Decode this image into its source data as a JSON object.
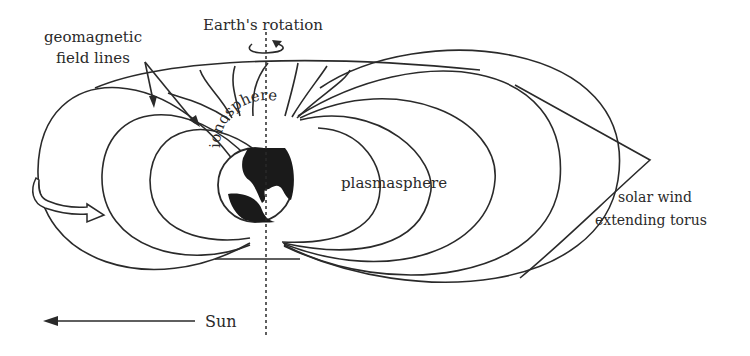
{
  "diagram": {
    "labels": {
      "geomagnetic_line1": "geomagnetic",
      "geomagnetic_line2": "field lines",
      "rotation": "Earth's rotation",
      "ionosphere": "ionosphere",
      "plasmasphere": "plasmasphere",
      "solar_wind_line1": "solar wind",
      "solar_wind_line2": "extending torus",
      "sun": "Sun"
    },
    "colors": {
      "ink": "#2a2a2a",
      "background": "#ffffff",
      "land": "#1a1a1a"
    }
  }
}
